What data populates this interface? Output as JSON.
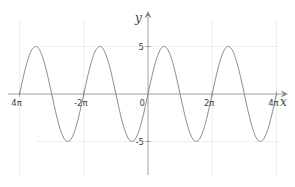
{
  "chart_data": {
    "type": "line",
    "title": "",
    "function": "y = 5 sin(x)",
    "xlabel": "x",
    "ylabel": "y",
    "xlim_over_pi": [
      -4,
      4
    ],
    "ylim": [
      -8,
      8.5
    ],
    "grid": true,
    "x_ticks": [
      {
        "value_over_pi": -4,
        "label": "4π"
      },
      {
        "value_over_pi": -2,
        "label": "-2π"
      },
      {
        "value_over_pi": 2,
        "label": "2π"
      },
      {
        "value_over_pi": 4,
        "label": "4π"
      }
    ],
    "origin_label": "0",
    "y_ticks": [
      {
        "value": 5,
        "label": "5"
      },
      {
        "value": -5,
        "label": "-5"
      }
    ],
    "series": [
      {
        "name": "5 sin(x)",
        "amplitude": 5,
        "x_range_over_pi": [
          -4,
          4
        ],
        "color": "#888888"
      }
    ],
    "colors": {
      "axis": "#888888",
      "grid": "#eeeeee",
      "curve": "#8a8a8a"
    }
  }
}
